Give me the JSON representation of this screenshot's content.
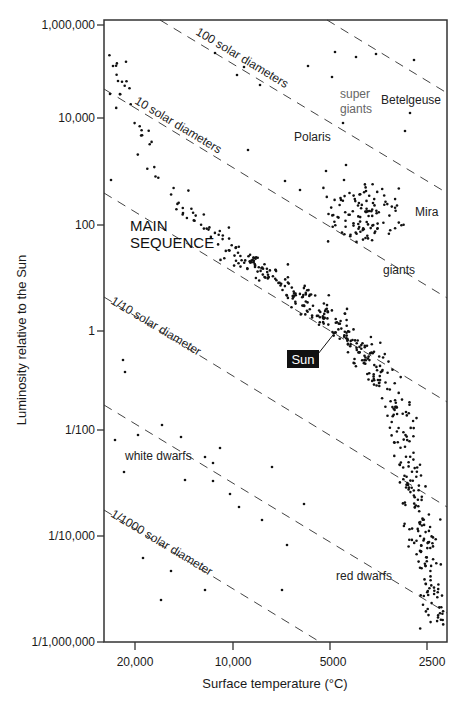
{
  "chart_data": {
    "type": "scatter",
    "title": "",
    "xlabel": "Surface temperature (°C)",
    "ylabel": "Luminosity relative to the Sun",
    "x_scale": "log (reversed)",
    "y_scale": "log",
    "x_ticks": [
      {
        "value": 20000,
        "label": "20,000"
      },
      {
        "value": 10000,
        "label": "10,000"
      },
      {
        "value": 5000,
        "label": "5000"
      },
      {
        "value": 2500,
        "label": "2500"
      }
    ],
    "y_ticks": [
      {
        "value": 1000000,
        "label": "1,000,000"
      },
      {
        "value": 10000,
        "label": "10,000"
      },
      {
        "value": 100,
        "label": "100"
      },
      {
        "value": 1,
        "label": "1"
      },
      {
        "value": 0.01,
        "label": "1/100"
      },
      {
        "value": 0.0001,
        "label": "1/10,000"
      },
      {
        "value": 1e-06,
        "label": "1/1,000,000"
      }
    ],
    "xlim": [
      30000,
      2200
    ],
    "ylim": [
      1e-06,
      1000000
    ],
    "grid": false,
    "radius_lines": [
      {
        "label": "",
        "solar_diameters": 1000
      },
      {
        "label": "100 solar diameters",
        "solar_diameters": 100
      },
      {
        "label": "10 solar diameters",
        "solar_diameters": 10
      },
      {
        "label": "",
        "solar_diameters": 1
      },
      {
        "label": "1/10 solar diameter",
        "solar_diameters": 0.1
      },
      {
        "label": "",
        "solar_diameters": 0.01
      },
      {
        "label": "1/1000 solar diameter",
        "solar_diameters": 0.001
      }
    ],
    "annotations": [
      {
        "text": "super",
        "region": "supergiants"
      },
      {
        "text": "giants",
        "region": "supergiants"
      },
      {
        "text": "Betelgeuse",
        "region": "supergiants"
      },
      {
        "text": "Polaris",
        "region": "supergiants"
      },
      {
        "text": "MAIN",
        "region": "main-sequence"
      },
      {
        "text": "SEQUENCE",
        "region": "main-sequence"
      },
      {
        "text": "Mira",
        "region": "giants"
      },
      {
        "text": "giants",
        "region": "giants"
      },
      {
        "text": "Sun",
        "region": "main-sequence",
        "temperature": 5800,
        "luminosity": 1
      },
      {
        "text": "white dwarfs",
        "region": "white-dwarfs"
      },
      {
        "text": "red dwarfs",
        "region": "red-dwarfs"
      }
    ],
    "series": [
      {
        "name": "stars",
        "note": "points as [x_px, y_px] within plot frame; ~600 stars"
      }
    ]
  },
  "labels": {
    "xlabel": "Surface temperature (°C)",
    "ylabel": "Luminosity relative to the Sun",
    "x_tick_20000": "20,000",
    "x_tick_10000": "10,000",
    "x_tick_5000": "5000",
    "x_tick_2500": "2500",
    "y_tick_1e6": "1,000,000",
    "y_tick_1e4": "10,000",
    "y_tick_1e2": "100",
    "y_tick_1": "1",
    "y_tick_1e-2": "1/100",
    "y_tick_1e-4": "1/10,000",
    "y_tick_1e-6": "1/1,000,000",
    "line_100": "100 solar diameters",
    "line_10": "10 solar diameters",
    "line_0_1": "1/10 solar diameter",
    "line_0_001": "1/1000 solar diameter",
    "super": "super",
    "super_giants": "giants",
    "betelgeuse": "Betelgeuse",
    "polaris": "Polaris",
    "main": "MAIN",
    "sequence": "SEQUENCE",
    "mira": "Mira",
    "giants": "giants",
    "sun": "Sun",
    "white_dwarfs": "white dwarfs",
    "red_dwarfs": "red dwarfs"
  },
  "colors": {
    "axis": "#333333",
    "dots": "#111111",
    "dash": "#444444",
    "sun_box": "#111111",
    "supergiant_text": "#666666"
  }
}
